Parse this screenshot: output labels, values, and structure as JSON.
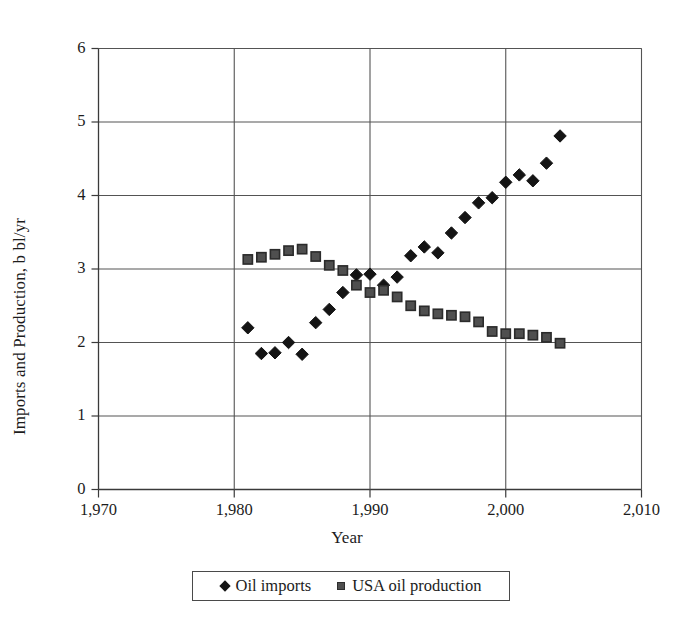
{
  "chart_data": {
    "type": "scatter",
    "title": "",
    "xlabel": "Year",
    "ylabel": "Imports and Production, b bl/yr",
    "xlim": [
      1970,
      2010
    ],
    "ylim": [
      0,
      6
    ],
    "grid": true,
    "grid_axis": "y",
    "legend_position": "bottom",
    "x_tick_labels": [
      "1,970",
      "1,980",
      "1,990",
      "2,000",
      "2,010"
    ],
    "x_ticks": [
      1970,
      1980,
      1990,
      2000,
      2010
    ],
    "y_tick_labels": [
      "0",
      "1",
      "2",
      "3",
      "4",
      "5",
      "6"
    ],
    "y_ticks": [
      0,
      1,
      2,
      3,
      4,
      5,
      6
    ],
    "series": [
      {
        "name": "Oil imports",
        "marker": "diamond",
        "color": "#141414",
        "points": [
          [
            1981,
            2.2
          ],
          [
            1982,
            1.85
          ],
          [
            1983,
            1.86
          ],
          [
            1984,
            2.0
          ],
          [
            1985,
            1.84
          ],
          [
            1986,
            2.27
          ],
          [
            1987,
            2.45
          ],
          [
            1988,
            2.68
          ],
          [
            1989,
            2.92
          ],
          [
            1990,
            2.93
          ],
          [
            1991,
            2.78
          ],
          [
            1992,
            2.89
          ],
          [
            1993,
            3.18
          ],
          [
            1994,
            3.3
          ],
          [
            1995,
            3.22
          ],
          [
            1996,
            3.49
          ],
          [
            1997,
            3.7
          ],
          [
            1998,
            3.9
          ],
          [
            1999,
            3.97
          ],
          [
            2000,
            4.18
          ],
          [
            2001,
            4.28
          ],
          [
            2002,
            4.2
          ],
          [
            2003,
            4.44
          ],
          [
            2004,
            4.81
          ]
        ]
      },
      {
        "name": "USA oil production",
        "marker": "square",
        "color": "#4f4f4f",
        "points": [
          [
            1981,
            3.13
          ],
          [
            1982,
            3.16
          ],
          [
            1983,
            3.2
          ],
          [
            1984,
            3.25
          ],
          [
            1985,
            3.27
          ],
          [
            1986,
            3.17
          ],
          [
            1987,
            3.05
          ],
          [
            1988,
            2.98
          ],
          [
            1989,
            2.78
          ],
          [
            1990,
            2.68
          ],
          [
            1991,
            2.71
          ],
          [
            1992,
            2.62
          ],
          [
            1993,
            2.5
          ],
          [
            1994,
            2.43
          ],
          [
            1995,
            2.39
          ],
          [
            1996,
            2.37
          ],
          [
            1997,
            2.35
          ],
          [
            1998,
            2.28
          ],
          [
            1999,
            2.15
          ],
          [
            2000,
            2.12
          ],
          [
            2001,
            2.12
          ],
          [
            2002,
            2.1
          ],
          [
            2003,
            2.07
          ],
          [
            2004,
            1.99
          ]
        ]
      }
    ]
  },
  "legend": {
    "entries": [
      {
        "label": "Oil imports",
        "marker": "diamond-marker-icon"
      },
      {
        "label": "USA oil production",
        "marker": "square-marker-icon"
      }
    ]
  },
  "axes": {
    "x_title": "Year",
    "y_title": "Imports and Production, b bl/yr"
  }
}
